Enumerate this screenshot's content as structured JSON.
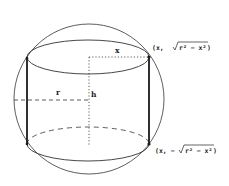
{
  "figure": {
    "colors": {
      "stroke": "#333333",
      "thick_stroke": "#1a1a1a",
      "background": "#ffffff"
    },
    "labels": {
      "x": "x",
      "r": "r",
      "h": "h",
      "top_point": "(x, √r² − x²)",
      "top_point_prefix": "(x, ",
      "top_point_radicand": "r² − x²",
      "top_point_suffix": ")",
      "bottom_point": "(x, −√r² − x²)",
      "bottom_point_prefix": "(x, −",
      "bottom_point_radicand": "r² − x²",
      "bottom_point_suffix": ")"
    }
  }
}
